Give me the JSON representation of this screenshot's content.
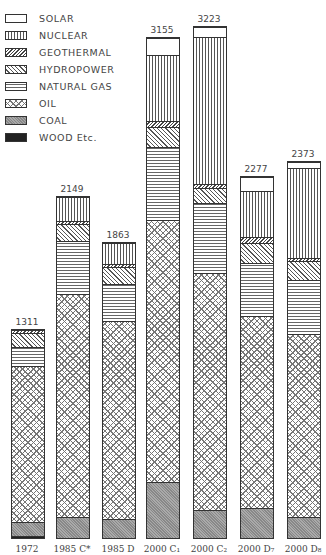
{
  "chart_data": {
    "type": "bar",
    "stacked": true,
    "title": "",
    "xlabel": "",
    "ylabel": "",
    "categories": [
      "1972",
      "1985 C*",
      "1985 D",
      "2000 C1",
      "2000 C2",
      "2000 D7",
      "2000 D8"
    ],
    "category_display": [
      "1972",
      "1985 C*",
      "1985 D",
      "2000 C₁",
      "2000 C₂",
      "2000 D₇",
      "2000 D₈"
    ],
    "totals": [
      1311,
      2149,
      1863,
      3155,
      3223,
      2277,
      2373
    ],
    "series": [
      {
        "key": "wood",
        "name": "WOOD Etc.",
        "values": [
          12,
          0,
          0,
          0,
          0,
          0,
          0
        ]
      },
      {
        "key": "coal",
        "name": "COAL",
        "values": [
          88,
          132,
          120,
          355,
          176,
          189,
          132
        ]
      },
      {
        "key": "oil",
        "name": "OIL",
        "values": [
          985,
          1405,
          1247,
          1650,
          1499,
          1210,
          1153
        ]
      },
      {
        "key": "natural_gas",
        "name": "NATURAL GAS",
        "values": [
          120,
          340,
          233,
          460,
          441,
          334,
          340
        ]
      },
      {
        "key": "hydropower",
        "name": "HYDROPOWER",
        "values": [
          88,
          107,
          113,
          126,
          95,
          126,
          120
        ]
      },
      {
        "key": "geothermal",
        "name": "GEOTHERMAL",
        "values": [
          18,
          19,
          19,
          38,
          25,
          38,
          19
        ]
      },
      {
        "key": "nuclear",
        "name": "NUCLEAR",
        "values": [
          0,
          146,
          131,
          420,
          923,
          292,
          572
        ]
      },
      {
        "key": "solar",
        "name": "SOLAR",
        "values": [
          0,
          0,
          0,
          106,
          64,
          88,
          37
        ]
      }
    ],
    "legend": {
      "position": "top-left",
      "entries": [
        "SOLAR",
        "NUCLEAR",
        "GEOTHERMAL",
        "HYDROPOWER",
        "NATURAL GAS",
        "OIL",
        "COAL",
        "WOOD Etc."
      ]
    },
    "grid": false,
    "ylim": [
      0,
      3300
    ]
  },
  "legend_items": [
    {
      "key": "solar",
      "label": "SOLAR"
    },
    {
      "key": "nuclear",
      "label": "NUCLEAR"
    },
    {
      "key": "geothermal",
      "label": "GEOTHERMAL"
    },
    {
      "key": "hydropower",
      "label": "HYDROPOWER"
    },
    {
      "key": "natural_gas",
      "label": "NATURAL GAS"
    },
    {
      "key": "oil",
      "label": "OIL"
    },
    {
      "key": "coal",
      "label": "COAL"
    },
    {
      "key": "wood",
      "label": "WOOD Etc."
    }
  ],
  "bars_layout": [
    {
      "x": 11,
      "total_label": "1311"
    },
    {
      "x": 56,
      "total_label": "2149"
    },
    {
      "x": 102,
      "total_label": "1863"
    },
    {
      "x": 146,
      "total_label": "3155"
    },
    {
      "x": 193,
      "total_label": "3223"
    },
    {
      "x": 240,
      "total_label": "2277"
    },
    {
      "x": 287,
      "total_label": "2373"
    }
  ],
  "pixels_per_unit": 0.1585
}
